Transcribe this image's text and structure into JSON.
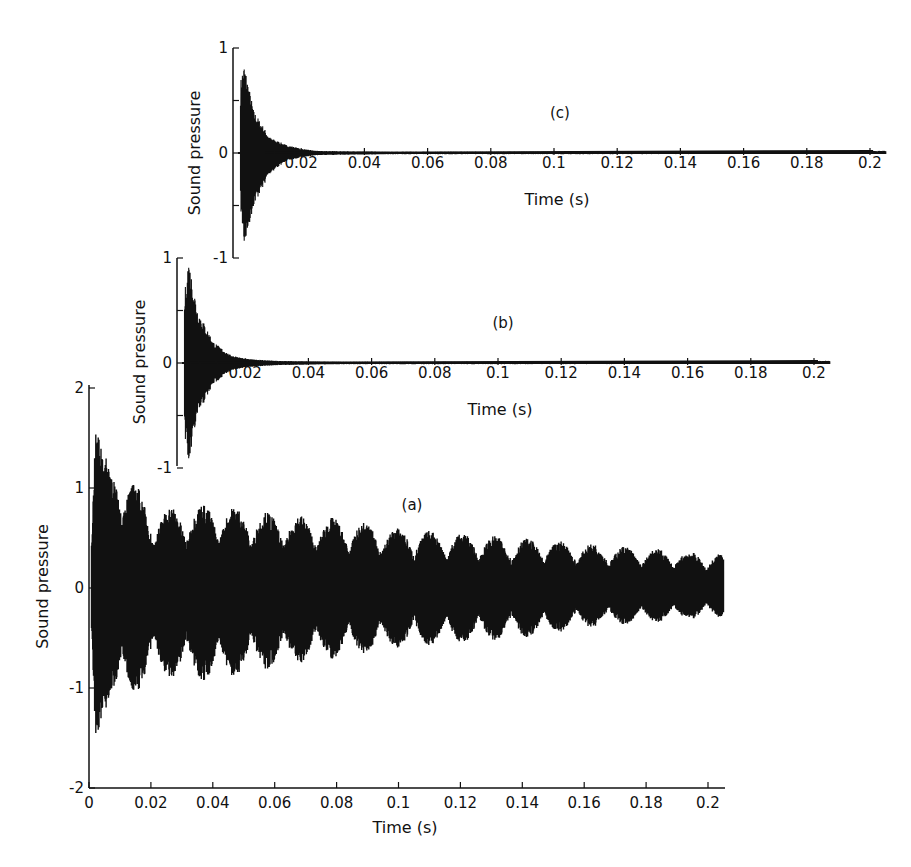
{
  "figure": {
    "panels": [
      {
        "id": "c",
        "label": "(c)",
        "ylabel": "Sound pressure",
        "xlabel": "Time (s)"
      },
      {
        "id": "b",
        "label": "(b)",
        "ylabel": "Sound pressure",
        "xlabel": "Time (s)"
      },
      {
        "id": "a",
        "label": "(a)",
        "ylabel": "Sound pressure",
        "xlabel": "Time (s)"
      }
    ]
  },
  "chart_data": [
    {
      "type": "line",
      "title": "(c)",
      "xlabel": "Time (s)",
      "ylabel": "Sound pressure",
      "xlim": [
        0,
        0.205
      ],
      "ylim": [
        -1,
        1
      ],
      "x_ticks": [
        "0.02",
        "0.04",
        "0.06",
        "0.08",
        "0.1",
        "0.12",
        "0.14",
        "0.16",
        "0.18",
        "0.2"
      ],
      "y_ticks": [
        "-1",
        "0",
        "1"
      ],
      "grid": false,
      "description": "Rapidly decaying oscillation; peak ~+0.85 / -0.9 near t=0.002 s, decays to near zero by ~0.025 s",
      "envelope": {
        "t": [
          0.001,
          0.002,
          0.005,
          0.01,
          0.015,
          0.02,
          0.025,
          0.05,
          0.1,
          0.2
        ],
        "upper": [
          0.75,
          0.85,
          0.4,
          0.15,
          0.08,
          0.04,
          0.02,
          0.01,
          0.01,
          0.02
        ],
        "lower": [
          -0.6,
          -0.9,
          -0.5,
          -0.2,
          -0.08,
          -0.04,
          -0.02,
          -0.01,
          -0.01,
          -0.01
        ]
      }
    },
    {
      "type": "line",
      "title": "(b)",
      "xlabel": "Time (s)",
      "ylabel": "Sound pressure",
      "xlim": [
        0,
        0.205
      ],
      "ylim": [
        -1,
        1
      ],
      "x_ticks": [
        "0.02",
        "0.04",
        "0.06",
        "0.08",
        "0.1",
        "0.12",
        "0.14",
        "0.16",
        "0.18",
        "0.2"
      ],
      "y_ticks": [
        "-1",
        "0",
        "1"
      ],
      "grid": false,
      "description": "Rapidly decaying oscillation; peak ~+1.0 / -1.0 near t=0.002 s, decays to near zero by ~0.02 s",
      "envelope": {
        "t": [
          0.001,
          0.002,
          0.005,
          0.01,
          0.015,
          0.02,
          0.03,
          0.05,
          0.1,
          0.2
        ],
        "upper": [
          0.7,
          1.0,
          0.5,
          0.2,
          0.08,
          0.04,
          0.02,
          0.01,
          0.01,
          0.02
        ],
        "lower": [
          -0.7,
          -1.0,
          -0.5,
          -0.2,
          -0.08,
          -0.04,
          -0.02,
          -0.01,
          -0.01,
          -0.01
        ]
      }
    },
    {
      "type": "line",
      "title": "(a)",
      "xlabel": "Time (s)",
      "ylabel": "Sound pressure",
      "xlim": [
        0,
        0.205
      ],
      "ylim": [
        -2,
        2
      ],
      "x_ticks": [
        "0",
        "0.02",
        "0.04",
        "0.06",
        "0.08",
        "0.1",
        "0.12",
        "0.14",
        "0.16",
        "0.18",
        "0.2"
      ],
      "y_ticks": [
        "-2",
        "-1",
        "0",
        "1",
        "2"
      ],
      "grid": false,
      "description": "Slowly decaying, beating oscillation; initial peak ~+1.9 / -1.8 near t=0.002 s, envelope decays to ~±0.35 by 0.2 s with beat period ~0.01 s",
      "envelope": {
        "t": [
          0.002,
          0.005,
          0.01,
          0.02,
          0.04,
          0.06,
          0.08,
          0.1,
          0.12,
          0.14,
          0.16,
          0.18,
          0.2
        ],
        "upper": [
          1.9,
          1.3,
          1.3,
          0.8,
          0.85,
          0.75,
          0.7,
          0.6,
          0.55,
          0.5,
          0.45,
          0.4,
          0.35
        ],
        "lower": [
          -1.8,
          -1.2,
          -1.2,
          -0.9,
          -0.95,
          -0.8,
          -0.7,
          -0.6,
          -0.55,
          -0.5,
          -0.4,
          -0.35,
          -0.3
        ]
      }
    }
  ]
}
